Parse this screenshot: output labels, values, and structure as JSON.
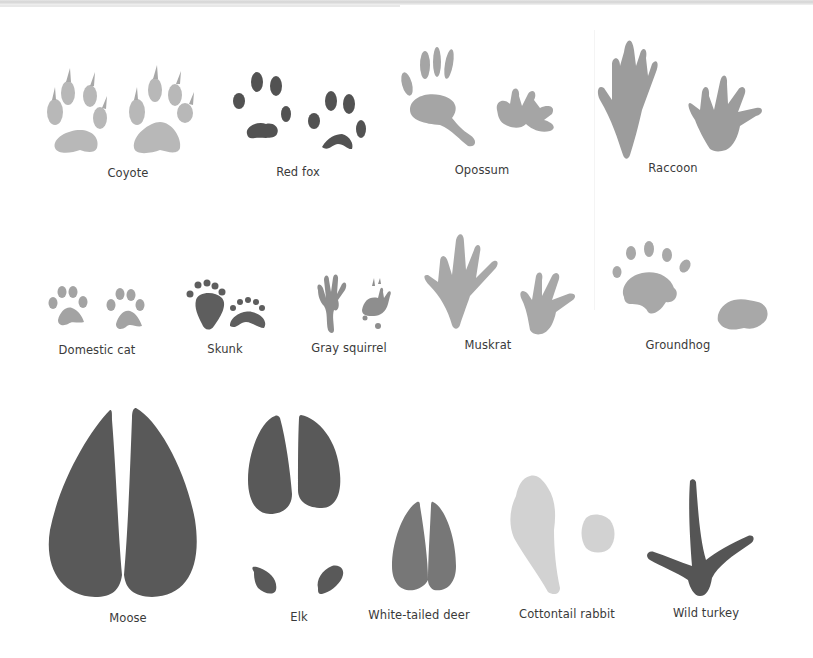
{
  "figure": {
    "colors": {
      "light_gray": "#b4b4b4",
      "mid_gray": "#9a9a9a",
      "dark_gray": "#555555",
      "very_light": "#cdcdcd"
    },
    "rows": [
      {
        "animals": [
          {
            "id": "coyote",
            "label": "Coyote"
          },
          {
            "id": "red-fox",
            "label": "Red fox"
          },
          {
            "id": "opossum",
            "label": "Opossum"
          },
          {
            "id": "raccoon",
            "label": "Raccoon"
          }
        ]
      },
      {
        "animals": [
          {
            "id": "domestic-cat",
            "label": "Domestic cat"
          },
          {
            "id": "skunk",
            "label": "Skunk"
          },
          {
            "id": "gray-squirrel",
            "label": "Gray squirrel"
          },
          {
            "id": "muskrat",
            "label": "Muskrat"
          },
          {
            "id": "groundhog",
            "label": "Groundhog"
          }
        ]
      },
      {
        "animals": [
          {
            "id": "moose",
            "label": "Moose"
          },
          {
            "id": "elk",
            "label": "Elk"
          },
          {
            "id": "white-tailed-deer",
            "label": "White-tailed deer"
          },
          {
            "id": "cottontail-rabbit",
            "label": "Cottontail rabbit"
          },
          {
            "id": "wild-turkey",
            "label": "Wild turkey"
          }
        ]
      }
    ]
  }
}
